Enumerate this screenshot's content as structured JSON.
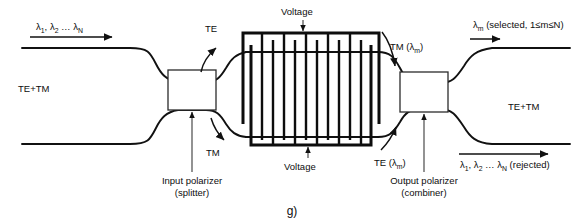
{
  "figure": {
    "caption": "g)",
    "labels": {
      "input_wavelengths": "λ",
      "input_sub_1": "1",
      "input_sub_2": "2",
      "input_ellipsis": "…",
      "input_sub_n": "N",
      "input_mode": "TE+TM",
      "te_upper": "TE",
      "tm_lower": "TM",
      "voltage_top": "Voltage",
      "voltage_bottom": "Voltage",
      "tm_selected": "TM (λ",
      "tm_selected_sub": "m",
      "tm_selected_close": ")",
      "te_selected": "TE (λ",
      "te_selected_sub": "m",
      "te_selected_close": ")",
      "input_polarizer_line1": "Input polarizer",
      "input_polarizer_line2": "(splitter)",
      "output_polarizer_line1": "Output polarizer",
      "output_polarizer_line2": "(combiner)",
      "output_selected_lambda": "λ",
      "output_selected_sub": "m",
      "output_selected_text": " (selected, 1≤m≤N)",
      "output_mode": "TE+TM",
      "rejected_lambda_1": "λ",
      "rejected_sub_1": "1",
      "rejected_lambda_2": ", λ",
      "rejected_sub_2": "2",
      "rejected_ellipsis": " … λ",
      "rejected_sub_n": "N",
      "rejected_suffix": " (rejected)"
    },
    "colors": {
      "waveguide": "#111111",
      "electrode": "#0d0d0d",
      "background": "#ffffff",
      "box_stroke": "#2b2b2b"
    },
    "electrode": {
      "finger_count_top": 6,
      "finger_count_bottom": 6,
      "period_count": 12
    }
  }
}
